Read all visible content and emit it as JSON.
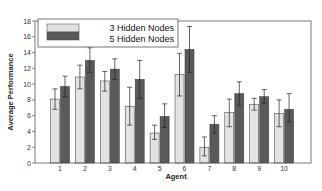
{
  "chart_data": {
    "type": "bar",
    "title": "",
    "xlabel": "Agent",
    "ylabel": "Average Performance",
    "categories": [
      "1",
      "2",
      "3",
      "4",
      "5",
      "6",
      "7",
      "8",
      "9",
      "10"
    ],
    "ylim": [
      0,
      18
    ],
    "yticks": [
      0,
      2,
      4,
      6,
      8,
      10,
      12,
      14,
      16,
      18
    ],
    "grid": false,
    "legend_position": "upper-left",
    "series": [
      {
        "name": "3 Hidden Nodes",
        "color": "#e2e2e2",
        "values": [
          8.1,
          10.9,
          10.4,
          7.2,
          3.8,
          11.2,
          2.0,
          6.4,
          7.4,
          6.3
        ],
        "error_low": [
          6.8,
          9.4,
          9.1,
          4.8,
          3.0,
          8.5,
          0.9,
          4.6,
          6.7,
          4.6
        ],
        "error_high": [
          9.4,
          12.4,
          11.6,
          9.6,
          4.8,
          13.9,
          3.3,
          8.1,
          8.2,
          8.0
        ]
      },
      {
        "name": "5 Hidden Nodes",
        "color": "#5a5a5a",
        "values": [
          9.7,
          13.0,
          11.9,
          10.6,
          5.9,
          14.4,
          4.9,
          8.8,
          8.4,
          6.8
        ],
        "error_low": [
          8.4,
          11.5,
          10.6,
          8.2,
          4.5,
          11.5,
          3.8,
          7.3,
          7.6,
          5.2
        ],
        "error_high": [
          11.0,
          14.6,
          13.2,
          13.0,
          7.5,
          17.3,
          6.0,
          10.3,
          9.3,
          8.8
        ]
      }
    ]
  }
}
